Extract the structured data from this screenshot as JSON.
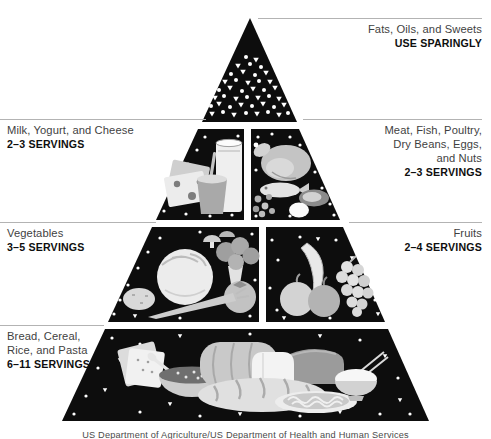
{
  "figure": {
    "caption": "US Department of Agriculture/US Department of Health and Human Services"
  },
  "labels": {
    "fats": {
      "name": "Fats, Oils, and Sweets",
      "servings": "USE SPARINGLY"
    },
    "milk": {
      "name": "Milk, Yogurt, and Cheese",
      "servings": "2–3 SERVINGS"
    },
    "meat": {
      "name_lines": [
        "Meat, Fish, Poultry,",
        "Dry Beans, Eggs,",
        "and Nuts"
      ],
      "servings": "2–3 SERVINGS"
    },
    "vegetables": {
      "name": "Vegetables",
      "servings": "3–5 SERVINGS"
    },
    "fruits": {
      "name": "Fruits",
      "servings": "2–4 SERVINGS"
    },
    "bread": {
      "name_lines": [
        "Bread, Cereal,",
        "Rice, and Pasta"
      ],
      "servings": "6–11 SERVINGS"
    }
  },
  "colors": {
    "pyramid_black": "#0d0d0d",
    "rule_gray": "#b3b3b3",
    "label_text": "#3f3f3f",
    "servings_text": "#0e0e0e",
    "background": "#ffffff",
    "illustration_light_gray": "#e6e6e6"
  }
}
